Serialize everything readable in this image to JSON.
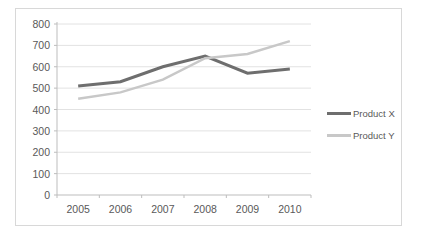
{
  "chart_data": {
    "type": "line",
    "title": "",
    "xlabel": "",
    "ylabel": "",
    "categories": [
      "2005",
      "2006",
      "2007",
      "2008",
      "2009",
      "2010"
    ],
    "series": [
      {
        "name": "Product X",
        "values": [
          510,
          530,
          600,
          650,
          570,
          590
        ],
        "color": "#6e6e6e",
        "width": 3
      },
      {
        "name": "Product Y",
        "values": [
          450,
          480,
          540,
          640,
          660,
          720
        ],
        "color": "#c8c8c8",
        "width": 2.5
      }
    ],
    "ylim": [
      0,
      800
    ],
    "ytick_step": 100,
    "grid": true,
    "legend_position": "right"
  },
  "colors": {
    "background": "#ffffff",
    "frame_border": "#d8d8d8",
    "gridline": "#e2e2e2",
    "axis_line": "#bdbdbd",
    "tick_mark": "#bdbdbd",
    "tick_label": "#595959"
  }
}
